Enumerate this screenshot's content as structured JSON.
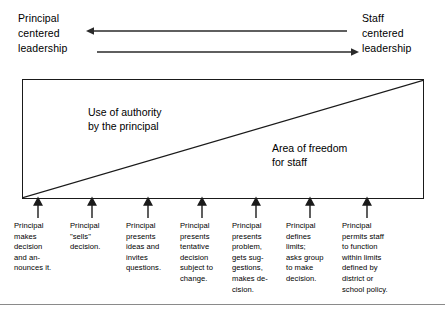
{
  "figure": {
    "header": {
      "left_label": "Principal\ncentered\nleadership",
      "right_label": "Staff\ncentered\nleadership",
      "arrow_to_principal": "left-arrow",
      "arrow_to_staff": "right-arrow"
    },
    "box": {
      "authority_label": "Use of authority\nby the principal",
      "freedom_label": "Area of freedom\nfor staff",
      "diagonal": "diagonal-divider"
    },
    "stages": [
      {
        "id": "stage-1",
        "text": "Principal\nmakes\ndecision\nand an-\nnounces it."
      },
      {
        "id": "stage-2",
        "text": "Principal\n\"sells\"\ndecision."
      },
      {
        "id": "stage-3",
        "text": "Principal\npresents\nideas and\ninvites\nquestions."
      },
      {
        "id": "stage-4",
        "text": "Principal\npresents\ntentative\ndecision\nsubject to\nchange."
      },
      {
        "id": "stage-5",
        "text": "Principal\npresents\nproblem,\ngets sug-\ngestions,\nmakes de-\ncision."
      },
      {
        "id": "stage-6",
        "text": "Principal\ndefines\nlimits;\nasks group\nto make\ndecision."
      },
      {
        "id": "stage-7",
        "text": "Principal\npermits staff\nto function\nwithin limits\ndefined by\ndistrict or\nschool policy."
      }
    ],
    "colors": {
      "line": "#1a1a1a",
      "text": "#000000",
      "rule": "#8a8a8a",
      "background": "#ffffff"
    }
  }
}
